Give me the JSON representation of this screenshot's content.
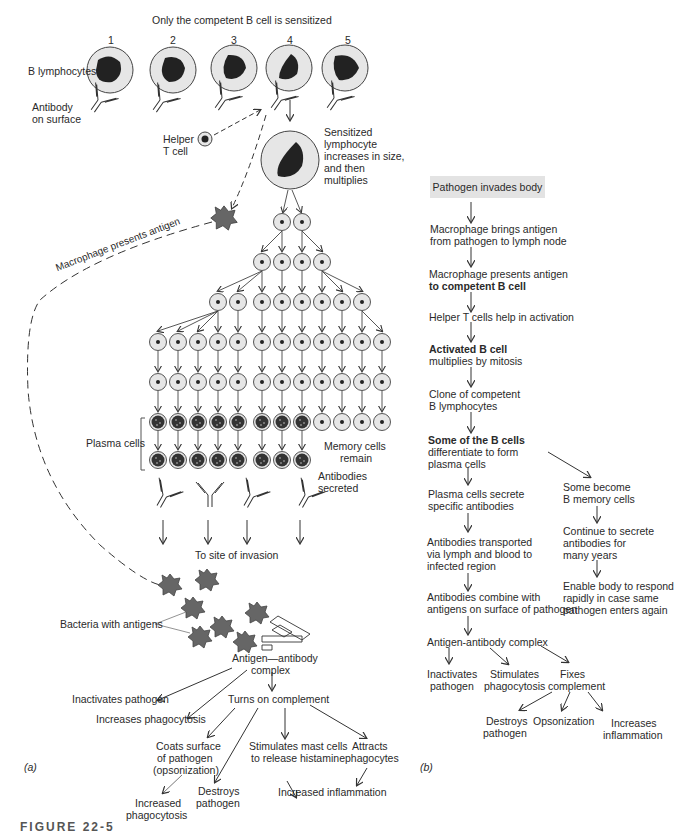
{
  "panel_a": {
    "label": "(a)",
    "title": "Only the competent B cell is sensitized",
    "cell_numbers": [
      "1",
      "2",
      "3",
      "4",
      "5"
    ],
    "b_lymphocytes": "B lymphocytes",
    "antibody_surface": [
      "Antibody",
      "on surface"
    ],
    "helper_t": [
      "Helper",
      "T cell"
    ],
    "sensitized": [
      "Sensitized",
      "lymphocyte",
      "increases in size,",
      "and then",
      "multiplies"
    ],
    "macrophage_presents": "Macrophage presents antigen",
    "plasma_cells": "Plasma cells",
    "memory_cells": [
      "Memory cells",
      "remain"
    ],
    "antibodies_secreted": [
      "Antibodies",
      "secreted"
    ],
    "site_of_invasion": "To site of invasion",
    "bacteria": "Bacteria with antigens",
    "complex": [
      "Antigen—antibody",
      "complex"
    ],
    "inactivates": "Inactivates pathogen",
    "increases_phago": "Increases phagocytosis",
    "turns_on": "Turns on complement",
    "coats": [
      "Coats surface",
      "of pathogen",
      "(opsonization)"
    ],
    "stimulates_mast": [
      "Stimulates mast cells",
      "to release histamine"
    ],
    "attracts": [
      "Attracts",
      "phagocytes"
    ],
    "destroys": [
      "Destroys",
      "pathogen"
    ],
    "increased_phago": [
      "Increased",
      "phagocytosis"
    ],
    "increased_inflam": "Increased inflammation"
  },
  "panel_b": {
    "label": "(b)",
    "steps": [
      {
        "lines": [
          "Pathogen invades body"
        ]
      },
      {
        "lines": [
          "Macrophage brings antigen",
          "from pathogen to lymph node"
        ]
      },
      {
        "lines": [
          "Macrophage presents antigen",
          "to competent B cell"
        ]
      },
      {
        "lines": [
          "Helper T cells help in activation"
        ]
      },
      {
        "lines": [
          "Activated B cell",
          "multiplies by mitosis"
        ]
      },
      {
        "lines": [
          "Clone of competent",
          "B lymphocytes"
        ]
      },
      {
        "lines": [
          "Some of the B cells",
          "differentiate to form",
          "plasma cells"
        ]
      },
      {
        "lines": [
          "Plasma cells secrete",
          "specific antibodies"
        ]
      },
      {
        "lines": [
          "Antibodies transported",
          "via lymph and blood to",
          "infected region"
        ]
      },
      {
        "lines": [
          "Antibodies combine with",
          "antigens on surface of pathogen"
        ]
      },
      {
        "lines": [
          "Antigen-antibody complex"
        ]
      }
    ],
    "memory_branch": [
      {
        "lines": [
          "Some become",
          "B memory cells"
        ]
      },
      {
        "lines": [
          "Continue to secrete",
          "antibodies for",
          "many years"
        ]
      },
      {
        "lines": [
          "Enable body to respond",
          "rapidly in case same",
          "pathogen enters again"
        ]
      }
    ],
    "outcomes": [
      {
        "lines": [
          "Inactivates",
          "pathogen"
        ]
      },
      {
        "lines": [
          "Stimulates",
          "phagocytosis"
        ]
      },
      {
        "lines": [
          "Fixes",
          "complement"
        ]
      }
    ],
    "complement_outcomes": [
      {
        "lines": [
          "Destroys",
          "pathogen"
        ]
      },
      {
        "lines": [
          "Opsonization"
        ]
      },
      {
        "lines": [
          "Increases",
          "inflammation"
        ]
      }
    ]
  },
  "caption_fragment": "FIGURE 22-5",
  "colors": {
    "cell_fill": "#e6e6e6",
    "nucleus": "#222222",
    "box": "#e3e3e3",
    "bacteria": "#666666",
    "line": "#333333"
  }
}
